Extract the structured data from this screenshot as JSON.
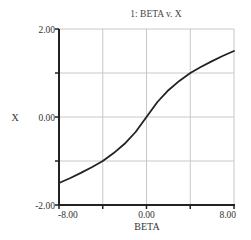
{
  "chart_data": {
    "type": "line",
    "title": "1: BETA v. X",
    "xlabel": "BETA",
    "ylabel": "X",
    "xlim": [
      -8,
      8
    ],
    "ylim": [
      -2,
      2
    ],
    "x_ticks": [
      -8,
      -4,
      0,
      4,
      8
    ],
    "y_ticks": [
      -2,
      -1,
      0,
      1,
      2
    ],
    "x_tick_labels": [
      "-8.00",
      "",
      "0.00",
      "",
      "8.00"
    ],
    "y_tick_labels": [
      "-2.00",
      "",
      "0.00",
      "",
      "2.00"
    ],
    "grid": true,
    "legend": null,
    "series": [
      {
        "name": "X",
        "color": "#222222",
        "x": [
          -8,
          -7,
          -6,
          -5,
          -4,
          -3,
          -2,
          -1,
          0,
          1,
          2,
          3,
          4,
          5,
          6,
          7,
          8
        ],
        "y": [
          -1.5,
          -1.39,
          -1.27,
          -1.14,
          -1.0,
          -0.82,
          -0.61,
          -0.34,
          0.0,
          0.34,
          0.61,
          0.82,
          1.0,
          1.14,
          1.27,
          1.39,
          1.5
        ]
      }
    ]
  },
  "colors": {
    "axis": "#222222",
    "grid": "#c8c8c8",
    "line": "#222222",
    "background": "#ffffff"
  }
}
